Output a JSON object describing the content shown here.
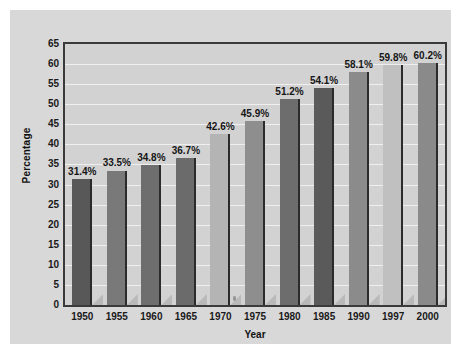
{
  "chart_data": {
    "type": "bar",
    "title": "",
    "xlabel": "Year",
    "ylabel": "Percentage",
    "categories": [
      "1950",
      "1955",
      "1960",
      "1965",
      "1970",
      "1975",
      "1980",
      "1985",
      "1990",
      "1997",
      "2000"
    ],
    "values": [
      31.4,
      33.5,
      34.8,
      36.7,
      42.6,
      45.9,
      51.2,
      54.1,
      58.1,
      59.8,
      60.2
    ],
    "data_labels": [
      "31.4%",
      "33.5%",
      "34.8%",
      "36.7%",
      "42.6%",
      "45.9%",
      "51.2%",
      "54.1%",
      "58.1%",
      "59.8%",
      "60.2%"
    ],
    "bar_colors": [
      "#585858",
      "#797979",
      "#6e6e6e",
      "#6b6b6b",
      "#b4b4b4",
      "#8e8e8e",
      "#6d6d6d",
      "#5a5a5a",
      "#8b8b8b",
      "#c0c0c0",
      "#8a8a8a"
    ],
    "ylim": [
      0,
      65
    ],
    "ytick_labels": [
      "65",
      "60",
      "55",
      "50",
      "45",
      "40",
      "35",
      "30",
      "25",
      "20",
      "15",
      "10",
      "5",
      "0"
    ],
    "ytick_values": [
      65,
      60,
      55,
      50,
      45,
      40,
      35,
      30,
      25,
      20,
      15,
      10,
      5,
      0
    ],
    "grid": true,
    "legend": "none",
    "plot_background": "#d2d2d2",
    "figure_background": "#d8d8d8",
    "gridline_color": "#efefef",
    "axis_color": "#3a3a3a"
  }
}
